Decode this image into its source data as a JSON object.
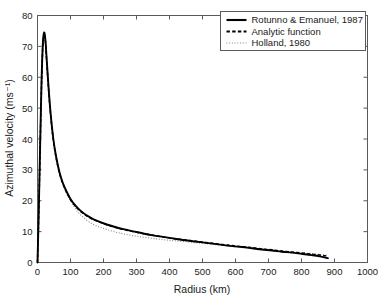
{
  "chart_data": {
    "type": "line",
    "title": "",
    "xlabel": "Radius (km)",
    "ylabel": "Azimuthal velocity (ms⁻¹)",
    "xlim": [
      0,
      1000
    ],
    "ylim": [
      0,
      80
    ],
    "xticks": [
      0,
      100,
      200,
      300,
      400,
      500,
      600,
      700,
      800,
      900,
      1000
    ],
    "yticks": [
      0,
      10,
      20,
      30,
      40,
      50,
      60,
      70,
      80
    ],
    "xtick_labels": [
      "0",
      "100",
      "200",
      "300",
      "400",
      "500",
      "600",
      "700",
      "800",
      "900",
      "1000"
    ],
    "ytick_labels": [
      "0",
      "10",
      "20",
      "30",
      "40",
      "50",
      "60",
      "70",
      "80"
    ],
    "grid": false,
    "legend_position": "top-right",
    "legend_entries": [
      {
        "label": "Rotunno & Emanuel, 1987",
        "style": "solid",
        "color": "#000000"
      },
      {
        "label": "Analytic function",
        "style": "dashed",
        "color": "#000000"
      },
      {
        "label": "Holland, 1980",
        "style": "dotted",
        "color": "#8a8a8a"
      }
    ],
    "x": [
      0,
      4,
      8,
      12,
      16,
      20,
      24,
      28,
      34,
      40,
      48,
      56,
      66,
      76,
      88,
      100,
      115,
      130,
      150,
      170,
      190,
      210,
      235,
      260,
      290,
      320,
      350,
      380,
      410,
      440,
      470,
      500,
      530,
      560,
      590,
      620,
      650,
      680,
      710,
      740,
      770,
      800,
      830,
      855,
      880
    ],
    "series": [
      {
        "name": "Rotunno & Emanuel, 1987",
        "style": "solid",
        "values": [
          0,
          17.5,
          38.0,
          57.5,
          70.5,
          74.5,
          72.0,
          65.5,
          56.0,
          48.0,
          40.0,
          34.5,
          29.5,
          26.0,
          23.0,
          20.6,
          18.4,
          16.8,
          15.2,
          14.0,
          13.1,
          12.3,
          11.5,
          10.8,
          10.1,
          9.4,
          8.8,
          8.3,
          7.8,
          7.3,
          6.9,
          6.5,
          6.1,
          5.7,
          5.3,
          5.0,
          4.6,
          4.2,
          3.9,
          3.5,
          3.2,
          2.8,
          2.4,
          2.0,
          1.4
        ]
      },
      {
        "name": "Analytic function",
        "style": "dashed",
        "values": [
          0,
          17.0,
          37.0,
          56.5,
          69.5,
          73.5,
          71.5,
          65.0,
          55.5,
          47.5,
          39.6,
          34.2,
          29.2,
          25.8,
          22.8,
          20.4,
          18.2,
          16.6,
          15.0,
          13.9,
          13.0,
          12.2,
          11.4,
          10.7,
          10.0,
          9.4,
          8.8,
          8.3,
          7.8,
          7.4,
          7.0,
          6.6,
          6.2,
          5.8,
          5.5,
          5.1,
          4.8,
          4.4,
          4.1,
          3.7,
          3.4,
          3.1,
          2.7,
          2.4,
          2.0
        ]
      },
      {
        "name": "Holland, 1980",
        "style": "dotted",
        "values": [
          0,
          17.0,
          37.5,
          57.0,
          70.0,
          74.0,
          71.5,
          65.0,
          55.5,
          47.5,
          39.5,
          34.0,
          29.0,
          25.5,
          22.4,
          19.9,
          17.4,
          15.5,
          13.6,
          12.3,
          11.4,
          10.7,
          9.9,
          9.3,
          8.7,
          8.2,
          7.8,
          7.4,
          7.1,
          6.8,
          6.5,
          6.2,
          5.9,
          5.6,
          5.3,
          5.0,
          4.7,
          4.4,
          4.1,
          3.8,
          3.5,
          3.2,
          2.9,
          2.6,
          2.3
        ]
      }
    ]
  }
}
